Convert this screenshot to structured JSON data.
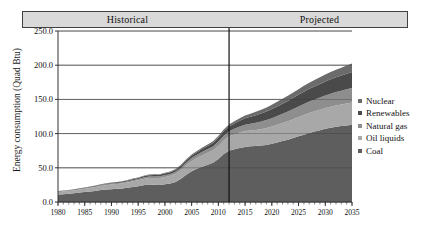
{
  "banner": {
    "historical_label": "Historical",
    "projected_label": "Projected",
    "fill": "#d9d9d9",
    "border": "#404040"
  },
  "legend": {
    "position": "right",
    "items": [
      {
        "label": "Nuclear",
        "color": "#6b6b6b"
      },
      {
        "label": "Renewables",
        "color": "#4a4a4a"
      },
      {
        "label": "Natural gas",
        "color": "#8e8e8e"
      },
      {
        "label": "Oil liquids",
        "color": "#a8a8a8"
      },
      {
        "label": "Coal",
        "color": "#5e5e5e"
      }
    ]
  },
  "chart_data": {
    "type": "area",
    "stacked": true,
    "title": "",
    "xlabel": "",
    "ylabel": "Energy consumption (Quad Btu)",
    "ylim": [
      0.0,
      250.0
    ],
    "xlim": [
      1980,
      2035
    ],
    "yticks": [
      0.0,
      50.0,
      100.0,
      150.0,
      200.0,
      250.0
    ],
    "ytick_labels": [
      "0.0",
      "50.0",
      "100.0",
      "150.0",
      "200.0",
      "250.0"
    ],
    "xticks": [
      1980,
      1985,
      1990,
      1995,
      2000,
      2005,
      2010,
      2015,
      2020,
      2025,
      2030,
      2035
    ],
    "xtick_labels": [
      "1980",
      "1985",
      "1990",
      "1995",
      "2000",
      "2005",
      "2010",
      "2015",
      "2020",
      "2025",
      "2030",
      "2035"
    ],
    "minor_xtick_step": 1,
    "grid": "horizontal",
    "divider_x": 2012,
    "divider_label": "historical-projected boundary",
    "x": [
      1980,
      1981,
      1982,
      1983,
      1984,
      1985,
      1986,
      1987,
      1988,
      1989,
      1990,
      1991,
      1992,
      1993,
      1994,
      1995,
      1996,
      1997,
      1998,
      1999,
      2000,
      2001,
      2002,
      2003,
      2004,
      2005,
      2006,
      2007,
      2008,
      2009,
      2010,
      2011,
      2012,
      2013,
      2014,
      2015,
      2016,
      2017,
      2018,
      2019,
      2020,
      2021,
      2022,
      2023,
      2024,
      2025,
      2026,
      2027,
      2028,
      2029,
      2030,
      2031,
      2032,
      2033,
      2034,
      2035
    ],
    "series": [
      {
        "name": "Coal",
        "color": "#5e5e5e",
        "values": [
          11.0,
          11.5,
          12.0,
          12.8,
          13.8,
          14.6,
          15.2,
          16.2,
          17.4,
          18.2,
          18.8,
          19.2,
          19.6,
          20.8,
          22.0,
          23.2,
          24.6,
          25.6,
          25.4,
          25.0,
          25.8,
          27.0,
          29.4,
          34.0,
          40.0,
          45.0,
          48.5,
          51.5,
          54.5,
          57.5,
          63.0,
          70.0,
          75.0,
          77.0,
          79.0,
          80.5,
          81.5,
          82.0,
          82.5,
          83.5,
          85.0,
          87.0,
          89.0,
          91.0,
          93.5,
          96.0,
          98.5,
          101.0,
          103.0,
          105.0,
          107.0,
          108.5,
          110.0,
          111.0,
          112.0,
          113.0
        ]
      },
      {
        "name": "Oil liquids",
        "color": "#a8a8a8",
        "values": [
          3.8,
          3.9,
          4.0,
          4.2,
          4.5,
          4.7,
          5.2,
          5.6,
          6.0,
          6.4,
          6.8,
          7.0,
          7.4,
          7.8,
          8.2,
          8.6,
          9.2,
          9.6,
          9.8,
          10.2,
          10.8,
          11.2,
          11.8,
          12.6,
          14.0,
          15.0,
          16.0,
          17.0,
          17.5,
          18.0,
          19.0,
          20.0,
          21.0,
          21.8,
          22.6,
          23.2,
          23.0,
          23.4,
          24.0,
          24.6,
          25.2,
          25.8,
          26.4,
          27.0,
          27.6,
          28.2,
          28.8,
          29.2,
          29.6,
          30.0,
          30.4,
          30.8,
          31.2,
          31.6,
          32.0,
          32.4
        ]
      },
      {
        "name": "Natural gas",
        "color": "#8e8e8e",
        "values": [
          0.6,
          0.6,
          0.7,
          0.7,
          0.8,
          0.8,
          0.9,
          1.0,
          1.1,
          1.2,
          1.3,
          1.4,
          1.5,
          1.6,
          1.7,
          1.8,
          2.0,
          2.1,
          2.2,
          2.4,
          2.6,
          2.8,
          3.0,
          3.4,
          3.8,
          4.2,
          4.6,
          5.0,
          5.4,
          5.8,
          6.4,
          7.0,
          7.6,
          8.2,
          8.8,
          9.4,
          10.0,
          10.6,
          11.2,
          11.8,
          12.4,
          13.0,
          13.6,
          14.2,
          14.8,
          15.4,
          16.0,
          16.6,
          17.2,
          17.8,
          18.4,
          19.0,
          19.6,
          20.2,
          20.8,
          21.4
        ]
      },
      {
        "name": "Renewables",
        "color": "#4a4a4a",
        "values": [
          0.5,
          0.5,
          0.6,
          0.6,
          0.7,
          0.7,
          0.8,
          0.9,
          0.9,
          1.0,
          1.1,
          1.2,
          1.3,
          1.4,
          1.5,
          1.6,
          1.8,
          1.9,
          2.0,
          2.1,
          2.3,
          2.4,
          2.6,
          2.9,
          3.2,
          3.5,
          3.8,
          4.2,
          4.6,
          5.0,
          5.6,
          6.2,
          6.8,
          7.6,
          8.4,
          9.2,
          10.0,
          10.8,
          11.6,
          12.4,
          13.2,
          14.0,
          14.8,
          15.6,
          16.4,
          17.2,
          18.0,
          18.6,
          19.2,
          19.8,
          20.4,
          21.0,
          21.6,
          22.2,
          22.8,
          23.4
        ]
      },
      {
        "name": "Nuclear",
        "color": "#6b6b6b",
        "values": [
          0.3,
          0.3,
          0.3,
          0.3,
          0.4,
          0.4,
          0.4,
          0.5,
          0.5,
          0.5,
          0.6,
          0.6,
          0.7,
          0.7,
          0.8,
          0.8,
          0.9,
          0.9,
          1.0,
          1.0,
          1.1,
          1.2,
          1.3,
          1.4,
          1.5,
          1.7,
          1.8,
          2.0,
          2.2,
          2.4,
          2.6,
          2.8,
          3.0,
          3.4,
          3.8,
          4.2,
          4.6,
          5.0,
          5.4,
          5.8,
          6.2,
          6.6,
          7.0,
          7.4,
          7.8,
          8.2,
          8.6,
          9.0,
          9.4,
          9.8,
          10.2,
          10.6,
          11.0,
          11.4,
          11.8,
          12.2
        ]
      }
    ]
  }
}
